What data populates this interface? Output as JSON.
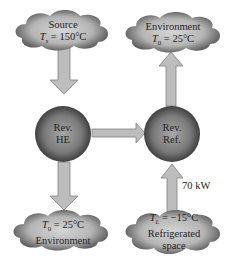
{
  "nodes": {
    "source": {
      "title": "Source",
      "temp_symbol": "T",
      "temp_sub": "s",
      "temp_value": " = 150°C"
    },
    "env_top": {
      "title": "Environment",
      "temp_symbol": "T",
      "temp_sub": "0",
      "temp_value": " = 25°C"
    },
    "rev_he": {
      "line1": "Rev.",
      "line2": "HE"
    },
    "rev_ref": {
      "line1": "Rev.",
      "line2": "Ref."
    },
    "env_bottom": {
      "title": "Environment",
      "temp_symbol": "T",
      "temp_sub": "0",
      "temp_value": " = 25°C"
    },
    "refrig_space": {
      "line1": "Refrigerated",
      "line2": "space",
      "temp_symbol": "T",
      "temp_sub": "L",
      "temp_value": " = −15°C"
    }
  },
  "annotations": {
    "cooling_load": "70 kW"
  },
  "colors": {
    "arrow": "#b8b8b8",
    "arrow_stroke": "#777777",
    "sphere_center": "#9a9a9a",
    "sphere_edge": "#3a3a3a",
    "cloud_light": "#c8c8c8",
    "cloud_dark": "#444444"
  }
}
